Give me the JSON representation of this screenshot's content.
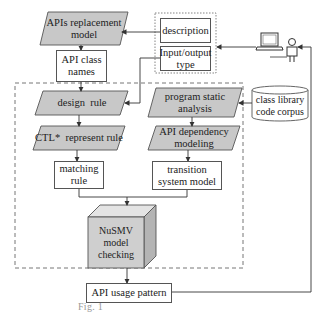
{
  "diagram": {
    "nodes": {
      "apis_replacement_model": "APIs replacement model",
      "api_class_names": "API class names",
      "description": "description",
      "input_output_type": "Input/output type",
      "design_rule": "design  rule",
      "program_static_analysis": "program static analysis",
      "class_library_code_corpus": "class library code corpus",
      "ctl_represent_rule": "CTL*  represent rule",
      "api_dependency_modeling": "API dependency modeling",
      "matching_rule": "matching rule",
      "transition_system_model": "transition system model",
      "nusmv_model_checking": "NuSMV model checking",
      "api_usage_pattern": "API usage pattern"
    },
    "icons": {
      "computer": "laptop-icon",
      "user": "person-icon"
    },
    "colors": {
      "parallelogram_fill": "#c8c8c8",
      "cube_front": "#cfcfcf",
      "cube_top": "#e4e4e4",
      "cube_side": "#b4b4b4",
      "stroke": "#555555"
    },
    "caption": "Fig. 1"
  }
}
